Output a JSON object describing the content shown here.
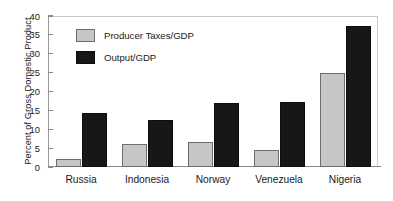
{
  "chart_data": {
    "type": "bar",
    "title": "",
    "xlabel": "",
    "ylabel": "Percent of Gross Domestic Product",
    "ylim": [
      0,
      40
    ],
    "ytick_step": 5,
    "yticks": [
      "40",
      "35",
      "30",
      "25",
      "20",
      "15",
      "10",
      "5",
      "0"
    ],
    "grid": false,
    "legend_position": "upper-left-inside",
    "categories": [
      "Russia",
      "Indonesia",
      "Norway",
      "Venezuela",
      "Nigeria"
    ],
    "series": [
      {
        "name": "Producer Taxes/GDP",
        "color": "#c6c6c6",
        "values": [
          2.1,
          6.2,
          6.7,
          4.4,
          24.9
        ]
      },
      {
        "name": "Output/GDP",
        "color": "#171717",
        "values": [
          14.2,
          12.5,
          17.0,
          17.3,
          37.4
        ]
      }
    ]
  },
  "axis": {
    "frame_color": "#8a8a8a"
  }
}
